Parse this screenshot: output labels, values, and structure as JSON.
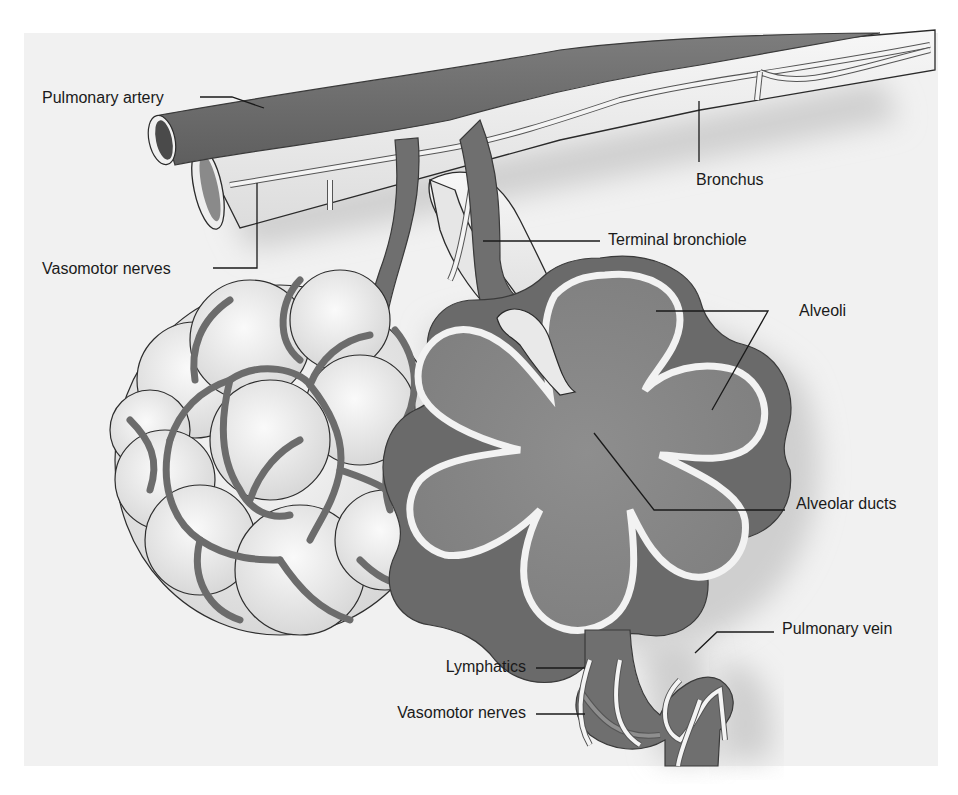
{
  "diagram": {
    "background_color": "#f1f1f1",
    "vessel_color": "#6f6f6f",
    "tissue_light_color": "#ededed",
    "alveolus_fill_color": "#8a8a8a"
  },
  "labels": {
    "pulmonary_artery": "Pulmonary artery",
    "vasomotor_nerves_upper": "Vasomotor nerves",
    "bronchus": "Bronchus",
    "terminal_bronchiole": "Terminal bronchiole",
    "alveoli": "Alveoli",
    "alveolar_ducts": "Alveolar ducts",
    "pulmonary_vein": "Pulmonary vein",
    "lymphatics": "Lymphatics",
    "vasomotor_nerves_lower": "Vasomotor nerves"
  }
}
